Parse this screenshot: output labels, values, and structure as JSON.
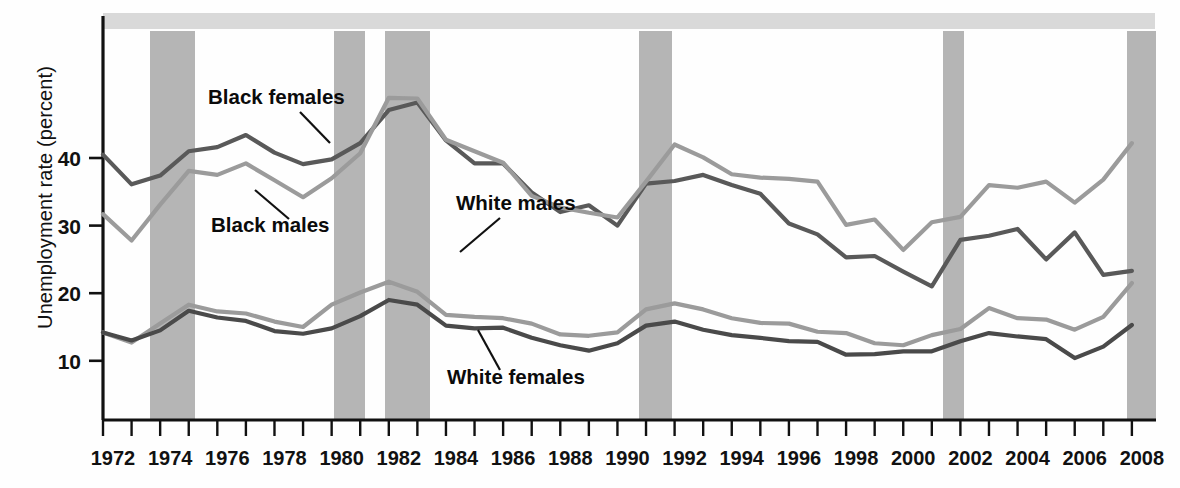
{
  "chart_data": {
    "type": "line",
    "title": "",
    "xlabel": "",
    "ylabel": "Unemployment rate (percent)",
    "xlim": [
      1971.6,
      2009.2
    ],
    "ylim": [
      0,
      52
    ],
    "yticks": [
      10,
      20,
      30,
      40
    ],
    "ytick_labels": [
      "10",
      "20",
      "30",
      "40"
    ],
    "grid": false,
    "legend_position": "inline-annotations",
    "x": [
      1972,
      1973,
      1974,
      1975,
      1976,
      1977,
      1978,
      1979,
      1980,
      1981,
      1982,
      1983,
      1984,
      1985,
      1986,
      1987,
      1988,
      1989,
      1990,
      1991,
      1992,
      1993,
      1994,
      1995,
      1996,
      1997,
      1998,
      1999,
      2000,
      2001,
      2002,
      2003,
      2004,
      2005,
      2006,
      2007,
      2008
    ],
    "xtick_labels": [
      "1972",
      "1974",
      "1976",
      "1978",
      "1980",
      "1982",
      "1984",
      "1986",
      "1988",
      "1990",
      "1992",
      "1994",
      "1996",
      "1998",
      "2000",
      "2002",
      "2004",
      "2006",
      "2008"
    ],
    "series": [
      {
        "name": "Black females",
        "color": "#595959",
        "values": [
          40.5,
          36.1,
          37.4,
          41.0,
          41.6,
          43.4,
          40.8,
          39.1,
          39.8,
          42.2,
          47.1,
          48.2,
          42.6,
          39.2,
          39.2,
          34.9,
          32.0,
          33.0,
          30.0,
          36.2,
          36.6,
          37.5,
          36.0,
          34.7,
          30.3,
          28.7,
          25.3,
          25.5,
          23.2,
          21.0,
          27.9,
          28.5,
          29.5,
          25.0,
          29.0,
          22.7,
          23.3
        ]
      },
      {
        "name": "Black males",
        "color": "#9b9b9b",
        "values": [
          31.7,
          27.8,
          33.1,
          38.1,
          37.5,
          39.2,
          36.7,
          34.2,
          37.0,
          40.7,
          48.9,
          48.8,
          42.7,
          41.0,
          39.3,
          34.4,
          32.7,
          31.9,
          31.2,
          36.5,
          42.0,
          40.1,
          37.6,
          37.1,
          36.9,
          36.5,
          30.1,
          30.9,
          26.4,
          30.5,
          31.3,
          36.0,
          35.6,
          36.5,
          33.4,
          36.8,
          42.2
        ]
      },
      {
        "name": "White males",
        "color": "#9b9b9b",
        "values": [
          14.2,
          12.7,
          15.5,
          18.3,
          17.3,
          17.0,
          15.8,
          15.0,
          18.3,
          20.1,
          21.7,
          20.2,
          16.8,
          16.5,
          16.3,
          15.5,
          13.9,
          13.7,
          14.2,
          17.6,
          18.5,
          17.6,
          16.3,
          15.6,
          15.5,
          14.3,
          14.1,
          12.6,
          12.3,
          13.8,
          14.7,
          17.8,
          16.3,
          16.1,
          14.6,
          16.5,
          21.5
        ]
      },
      {
        "name": "White females",
        "color": "#4a4a4a",
        "values": [
          14.2,
          13.0,
          14.5,
          17.4,
          16.4,
          15.9,
          14.4,
          14.0,
          14.8,
          16.6,
          19.0,
          18.3,
          15.2,
          14.8,
          14.9,
          13.4,
          12.3,
          11.5,
          12.6,
          15.2,
          15.8,
          14.6,
          13.8,
          13.4,
          12.9,
          12.8,
          10.9,
          11.0,
          11.4,
          11.4,
          12.9,
          14.1,
          13.6,
          13.2,
          10.4,
          12.1,
          15.3
        ]
      }
    ],
    "annotations": [
      {
        "label": "Black females",
        "text_x": 208,
        "text_y": 104,
        "leader": [
          [
            300,
            112
          ],
          [
            330,
            143
          ]
        ]
      },
      {
        "label": "Black males",
        "text_x": 211,
        "text_y": 232,
        "leader": [
          [
            289,
            219
          ],
          [
            255,
            190
          ]
        ]
      },
      {
        "label": "White males",
        "text_x": 456,
        "text_y": 210,
        "leader": [
          [
            500,
            218
          ],
          [
            460,
            252
          ]
        ]
      },
      {
        "label": "White females",
        "text_x": 447,
        "text_y": 384,
        "leader": [
          [
            500,
            370
          ],
          [
            478,
            330
          ]
        ]
      }
    ],
    "recession_bands": [
      {
        "x0": 150,
        "x1": 195
      },
      {
        "x0": 334,
        "x1": 365
      },
      {
        "x0": 385,
        "x1": 430
      },
      {
        "x0": 639,
        "x1": 672
      },
      {
        "x0": 943,
        "x1": 964
      },
      {
        "x0": 1127,
        "x1": 1156
      }
    ],
    "band_color": "#b5b5b5",
    "axis_color": "#111111"
  }
}
